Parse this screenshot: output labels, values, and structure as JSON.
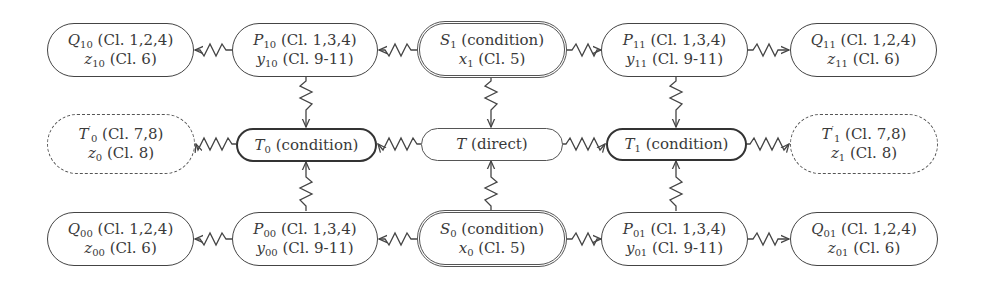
{
  "diagram": {
    "title": "",
    "nodes": {
      "Q10": {
        "sym": "Q",
        "sub": "10",
        "ann1": " (Cl. 1,2,4)",
        "var": "z",
        "vsub": "10",
        "ann2": " (Cl. 6)"
      },
      "P10": {
        "sym": "P",
        "sub": "10",
        "ann1": " (Cl. 1,3,4)",
        "var": "y",
        "vsub": "10",
        "ann2": " (Cl. 9-11)"
      },
      "S1": {
        "sym": "S",
        "sub": "1",
        "ann1": " (condition)",
        "var": "x",
        "vsub": "1",
        "ann2": " (Cl. 5)"
      },
      "P11": {
        "sym": "P",
        "sub": "11",
        "ann1": " (Cl. 1,3,4)",
        "var": "y",
        "vsub": "11",
        "ann2": " (Cl. 9-11)"
      },
      "Q11": {
        "sym": "Q",
        "sub": "11",
        "ann1": " (Cl. 1,2,4)",
        "var": "z",
        "vsub": "11",
        "ann2": " (Cl. 6)"
      },
      "T0p": {
        "sym": "T",
        "sup": "′",
        "sub": "0",
        "ann1": " (Cl. 7,8)",
        "var": "z",
        "vsub": "0",
        "ann2": " (Cl. 8)"
      },
      "T0": {
        "sym": "T",
        "sub": "0",
        "ann1": " (condition)"
      },
      "T": {
        "sym": "T",
        "ann1": " (direct)"
      },
      "T1": {
        "sym": "T",
        "sub": "1",
        "ann1": " (condition)"
      },
      "T1p": {
        "sym": "T",
        "sup": "′",
        "sub": "1",
        "ann1": " (Cl. 7,8)",
        "var": "z",
        "vsub": "1",
        "ann2": " (Cl. 8)"
      },
      "Q00": {
        "sym": "Q",
        "sub": "00",
        "ann1": " (Cl. 1,2,4)",
        "var": "z",
        "vsub": "00",
        "ann2": " (Cl. 6)"
      },
      "P00": {
        "sym": "P",
        "sub": "00",
        "ann1": " (Cl. 1,3,4)",
        "var": "y",
        "vsub": "00",
        "ann2": " (Cl. 9-11)"
      },
      "S0": {
        "sym": "S",
        "sub": "0",
        "ann1": " (condition)",
        "var": "x",
        "vsub": "0",
        "ann2": " (Cl. 5)"
      },
      "P01": {
        "sym": "P",
        "sub": "01",
        "ann1": " (Cl. 1,3,4)",
        "var": "y",
        "vsub": "01",
        "ann2": " (Cl. 9-11)"
      },
      "Q01": {
        "sym": "Q",
        "sub": "01",
        "ann1": " (Cl. 1,2,4)",
        "var": "z",
        "vsub": "01",
        "ann2": " (Cl. 6)"
      }
    },
    "edges": [
      {
        "from": "P10",
        "to": "Q10",
        "style": "snake-arrow"
      },
      {
        "from": "S1",
        "to": "P10",
        "style": "snake-arrow"
      },
      {
        "from": "S1",
        "to": "P11",
        "style": "snake-arrow"
      },
      {
        "from": "P11",
        "to": "Q11",
        "style": "snake-arrow"
      },
      {
        "from": "P10",
        "to": "T0",
        "style": "snake-arrow"
      },
      {
        "from": "S1",
        "to": "T",
        "style": "snake-arrow"
      },
      {
        "from": "P11",
        "to": "T1",
        "style": "snake-arrow"
      },
      {
        "from": "T0",
        "to": "T0p",
        "style": "snake-arrow"
      },
      {
        "from": "T",
        "to": "T0",
        "style": "snake-arrow"
      },
      {
        "from": "T",
        "to": "T1",
        "style": "snake-arrow"
      },
      {
        "from": "T1",
        "to": "T1p",
        "style": "snake-arrow"
      },
      {
        "from": "P00",
        "to": "T0",
        "style": "snake-arrow"
      },
      {
        "from": "S0",
        "to": "T",
        "style": "snake-arrow"
      },
      {
        "from": "P01",
        "to": "T1",
        "style": "snake-arrow"
      },
      {
        "from": "P00",
        "to": "Q00",
        "style": "snake-arrow"
      },
      {
        "from": "S0",
        "to": "P00",
        "style": "snake-arrow"
      },
      {
        "from": "S0",
        "to": "P01",
        "style": "snake-arrow"
      },
      {
        "from": "P01",
        "to": "Q01",
        "style": "snake-arrow"
      }
    ],
    "colors": {
      "stroke": "#444444",
      "text": "#3a3a3a",
      "background": "#ffffff"
    }
  }
}
